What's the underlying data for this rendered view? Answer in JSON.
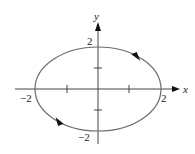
{
  "diagram": {
    "type": "parametric-curve",
    "axes": {
      "x_label": "x",
      "y_label": "y",
      "x_ticks": [
        -2,
        -1,
        1,
        2
      ],
      "y_ticks": [
        -2,
        -1,
        1,
        2
      ],
      "x_tick_labels": {
        "neg": "−2",
        "pos": "2"
      },
      "y_tick_labels": {
        "neg": "−2",
        "pos": "2"
      }
    },
    "curve": {
      "shape": "ellipse",
      "center": [
        0,
        0
      ],
      "x_radius": 2,
      "y_radius": 2,
      "direction": "clockwise",
      "stroke_color": "#6b6b6b"
    },
    "colors": {
      "axis": "#444444",
      "curve": "#6b6b6b",
      "arrow": "#111111"
    }
  }
}
